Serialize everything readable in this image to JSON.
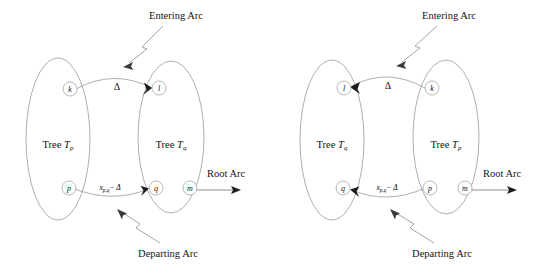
{
  "figure": {
    "title_left": "",
    "title_right": "",
    "background_color": "#ffffff",
    "line_color": "#8d8d8d",
    "text_color": "#141414"
  },
  "labels": {
    "entering_arc": "Entering Arc",
    "departing_arc": "Departing Arc",
    "root_arc": "Root Arc",
    "delta": "Δ",
    "flow_base": "x",
    "flow_subscript": "p,q",
    "flow_minus_delta": "− Δ"
  },
  "panels": [
    {
      "id": "left-panel",
      "trees": [
        {
          "id": "tree-left",
          "label_prefix": "Tree ",
          "label_symbol": "T",
          "label_subscript": "p"
        },
        {
          "id": "tree-right",
          "label_prefix": "Tree ",
          "label_symbol": "T",
          "label_subscript": "q"
        }
      ],
      "nodes": [
        {
          "id": "node-k",
          "label": "k",
          "position": "top-left-tree"
        },
        {
          "id": "node-l",
          "label": "l",
          "position": "top-right-tree"
        },
        {
          "id": "node-p",
          "label": "p",
          "position": "bottom-left-tree"
        },
        {
          "id": "node-q",
          "label": "q",
          "position": "bottom-right-tree"
        },
        {
          "id": "node-m",
          "label": "m",
          "position": "bottom-right-tree-inner"
        }
      ],
      "arcs": [
        {
          "id": "entering-arc",
          "from": "k",
          "to": "l",
          "label": "Δ",
          "direction": "right"
        },
        {
          "id": "departing-arc",
          "from": "p",
          "to": "q",
          "label": "x p,q − Δ",
          "direction": "right"
        },
        {
          "id": "root-arc",
          "from": "m",
          "to": "root",
          "label": "Root Arc",
          "direction": "right"
        }
      ]
    },
    {
      "id": "right-panel",
      "trees": [
        {
          "id": "tree-left",
          "label_prefix": "Tree ",
          "label_symbol": "T",
          "label_subscript": "q"
        },
        {
          "id": "tree-right",
          "label_prefix": "Tree ",
          "label_symbol": "T",
          "label_subscript": "p"
        }
      ],
      "nodes": [
        {
          "id": "node-l",
          "label": "l",
          "position": "top-left-tree"
        },
        {
          "id": "node-k",
          "label": "k",
          "position": "top-right-tree"
        },
        {
          "id": "node-q",
          "label": "q",
          "position": "bottom-left-tree"
        },
        {
          "id": "node-p",
          "label": "p",
          "position": "bottom-right-tree"
        },
        {
          "id": "node-m",
          "label": "m",
          "position": "bottom-right-tree-inner"
        }
      ],
      "arcs": [
        {
          "id": "entering-arc",
          "from": "k",
          "to": "l",
          "label": "Δ",
          "direction": "left"
        },
        {
          "id": "departing-arc",
          "from": "p",
          "to": "q",
          "label": "x p,q − Δ",
          "direction": "left"
        },
        {
          "id": "root-arc",
          "from": "m",
          "to": "root",
          "label": "Root Arc",
          "direction": "right"
        }
      ]
    }
  ]
}
